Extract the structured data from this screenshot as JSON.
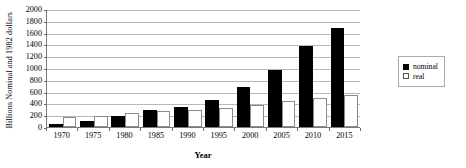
{
  "chart_data": {
    "type": "bar",
    "title": "",
    "xlabel": "Year",
    "ylabel": "Billions Nominal and 1982 dollars",
    "categories": [
      "1970",
      "1975",
      "1980",
      "1985",
      "1990",
      "1995",
      "2000",
      "2005",
      "2010",
      "2015"
    ],
    "series": [
      {
        "name": "nominal",
        "color": "#000000",
        "values": [
          50,
          95,
          190,
          280,
          340,
          450,
          670,
          970,
          1380,
          1680
        ]
      },
      {
        "name": "real",
        "color": "#ffffff",
        "values": [
          170,
          185,
          230,
          265,
          280,
          320,
          375,
          440,
          490,
          545
        ]
      }
    ],
    "ylim": [
      0,
      2000
    ],
    "y_ticks": [
      0,
      200,
      400,
      600,
      800,
      1000,
      1200,
      1400,
      1600,
      1800,
      2000
    ],
    "grid": "horizontal",
    "legend_position": "right"
  },
  "legend": {
    "entries": [
      {
        "label": "nominal"
      },
      {
        "label": "real"
      }
    ]
  }
}
